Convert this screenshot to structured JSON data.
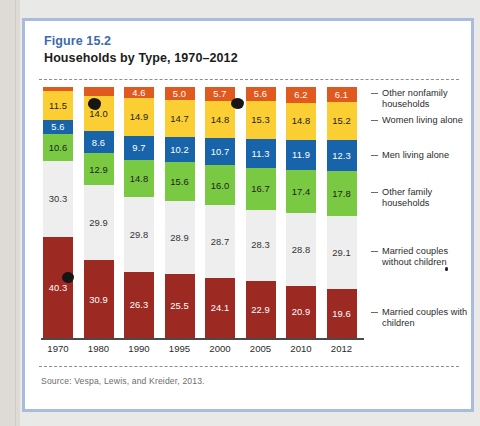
{
  "figure": {
    "number": "Figure 15.2",
    "title": "Households by Type, 1970–2012",
    "source": "Source: Vespa, Lewis, and Kreider, 2013."
  },
  "chart_data": {
    "type": "bar",
    "stacked": true,
    "title": "Households by Type, 1970–2012",
    "xlabel": "",
    "ylabel": "",
    "ylim": [
      0,
      100
    ],
    "grid": false,
    "legend_position": "right",
    "categories": [
      "1970",
      "1980",
      "1990",
      "1995",
      "2000",
      "2005",
      "2010",
      "2012"
    ],
    "series": [
      {
        "name": "Married couples with children",
        "color": "#9d2a22",
        "text_color": "#ffffff",
        "values": [
          40.3,
          30.9,
          26.3,
          25.5,
          24.1,
          22.9,
          20.9,
          19.6
        ]
      },
      {
        "name": "Married couples without children",
        "color": "#eeeeee",
        "text_color": "#333333",
        "values": [
          30.3,
          29.9,
          29.8,
          28.9,
          28.7,
          28.3,
          28.8,
          29.1
        ]
      },
      {
        "name": "Other family households",
        "color": "#7ac943",
        "text_color": "#1c1c1c",
        "values": [
          10.6,
          12.9,
          14.8,
          15.6,
          16.0,
          16.7,
          17.4,
          17.8
        ]
      },
      {
        "name": "Men living alone",
        "color": "#1764ab",
        "text_color": "#ffffff",
        "values": [
          5.6,
          8.6,
          9.7,
          10.2,
          10.7,
          11.3,
          11.9,
          12.3
        ]
      },
      {
        "name": "Women living alone",
        "color": "#fbcf33",
        "text_color": "#1c1c1c",
        "values": [
          11.5,
          14.0,
          14.9,
          14.7,
          14.8,
          15.3,
          14.8,
          15.2
        ]
      },
      {
        "name": "Other nonfamily households",
        "color": "#e0591f",
        "text_color": "#ffffff",
        "values": [
          1.7,
          3.6,
          4.6,
          5.0,
          5.7,
          5.6,
          6.2,
          6.1
        ]
      }
    ],
    "legend_entries": [
      "Other nonfamily households",
      "Women living alone",
      "Men living alone",
      "Other family households",
      "Married couples without children",
      "Married couples with children"
    ]
  }
}
